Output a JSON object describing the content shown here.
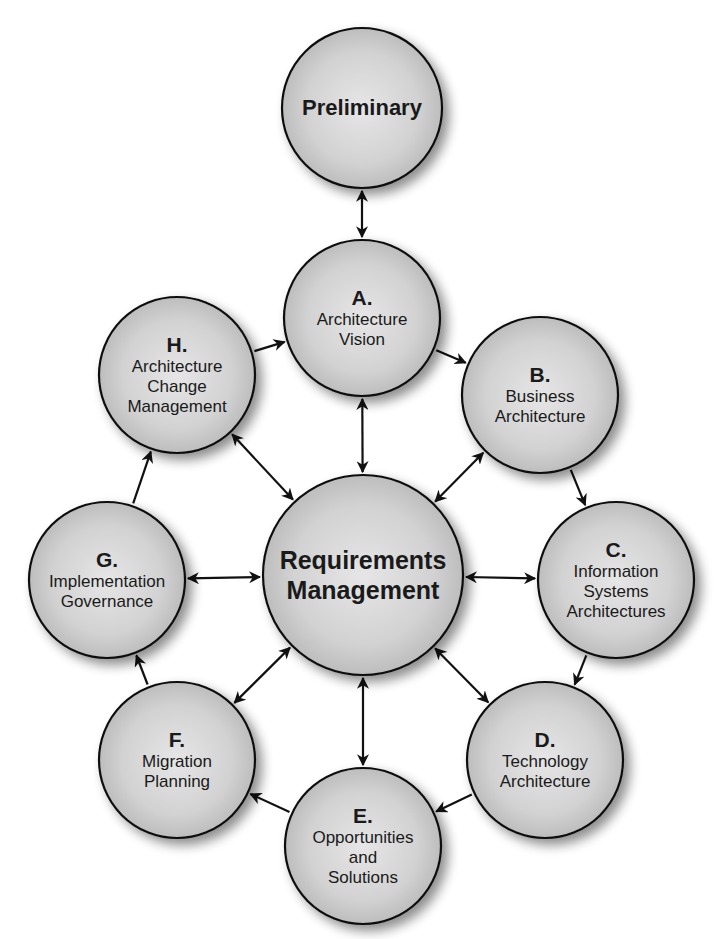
{
  "diagram": {
    "colors": {
      "fill_center": "#e4e4e4",
      "fill_edge": "#b8b8b8",
      "stroke": "#111111",
      "arrow": "#111111",
      "background": "#ffffff"
    },
    "nodes": [
      {
        "id": "preliminary",
        "letter": "",
        "lines": [
          "Preliminary"
        ],
        "cx": 362,
        "cy": 108,
        "r": 80
      },
      {
        "id": "a",
        "letter": "A.",
        "lines": [
          "Architecture",
          "Vision"
        ],
        "cx": 362,
        "cy": 318,
        "r": 78
      },
      {
        "id": "b",
        "letter": "B.",
        "lines": [
          "Business",
          "Architecture"
        ],
        "cx": 540,
        "cy": 395,
        "r": 78
      },
      {
        "id": "c",
        "letter": "C.",
        "lines": [
          "Information",
          "Systems",
          "Architectures"
        ],
        "cx": 616,
        "cy": 580,
        "r": 78
      },
      {
        "id": "d",
        "letter": "D.",
        "lines": [
          "Technology",
          "Architecture"
        ],
        "cx": 545,
        "cy": 760,
        "r": 78
      },
      {
        "id": "e",
        "letter": "E.",
        "lines": [
          "Opportunities",
          "and",
          "Solutions"
        ],
        "cx": 363,
        "cy": 846,
        "r": 78
      },
      {
        "id": "f",
        "letter": "F.",
        "lines": [
          "Migration",
          "Planning"
        ],
        "cx": 177,
        "cy": 760,
        "r": 78
      },
      {
        "id": "g",
        "letter": "G.",
        "lines": [
          "Implementation",
          "Governance"
        ],
        "cx": 107,
        "cy": 580,
        "r": 78
      },
      {
        "id": "h",
        "letter": "H.",
        "lines": [
          "Architecture",
          "Change",
          "Management"
        ],
        "cx": 177,
        "cy": 375,
        "r": 78
      },
      {
        "id": "requirements",
        "letter": "",
        "lines": [
          "Requirements",
          "Management"
        ],
        "cx": 363,
        "cy": 575,
        "r": 100
      }
    ],
    "edges": [
      {
        "from": "preliminary",
        "to": "a",
        "type": "bidirectional"
      },
      {
        "from": "a",
        "to": "b",
        "type": "directed"
      },
      {
        "from": "b",
        "to": "c",
        "type": "directed"
      },
      {
        "from": "c",
        "to": "d",
        "type": "directed"
      },
      {
        "from": "d",
        "to": "e",
        "type": "directed"
      },
      {
        "from": "e",
        "to": "f",
        "type": "directed"
      },
      {
        "from": "f",
        "to": "g",
        "type": "directed"
      },
      {
        "from": "g",
        "to": "h",
        "type": "directed"
      },
      {
        "from": "h",
        "to": "a",
        "type": "directed"
      },
      {
        "from": "requirements",
        "to": "a",
        "type": "bidirectional"
      },
      {
        "from": "requirements",
        "to": "b",
        "type": "bidirectional"
      },
      {
        "from": "requirements",
        "to": "c",
        "type": "bidirectional"
      },
      {
        "from": "requirements",
        "to": "d",
        "type": "bidirectional"
      },
      {
        "from": "requirements",
        "to": "e",
        "type": "bidirectional"
      },
      {
        "from": "requirements",
        "to": "f",
        "type": "bidirectional"
      },
      {
        "from": "requirements",
        "to": "g",
        "type": "bidirectional"
      },
      {
        "from": "requirements",
        "to": "h",
        "type": "bidirectional"
      }
    ]
  }
}
